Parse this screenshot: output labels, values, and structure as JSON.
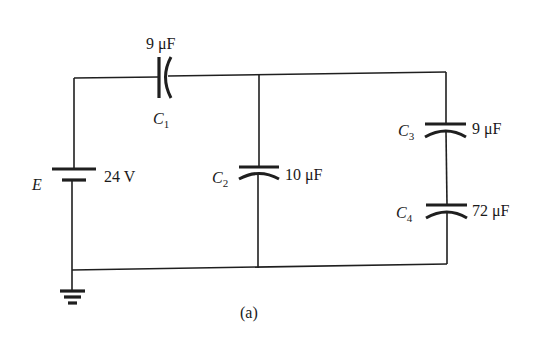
{
  "figure": {
    "caption": "(a)",
    "source": {
      "symbol": "E",
      "value": "24 V"
    },
    "capacitors": [
      {
        "id": "C1",
        "name": "C",
        "subscript": "1",
        "value": "9 μF",
        "position": "top wire, series"
      },
      {
        "id": "C2",
        "name": "C",
        "subscript": "2",
        "value": "10 μF",
        "position": "middle branch"
      },
      {
        "id": "C3",
        "name": "C",
        "subscript": "3",
        "value": "9 μF",
        "position": "right branch, upper"
      },
      {
        "id": "C4",
        "name": "C",
        "subscript": "4",
        "value": "72 μF",
        "position": "right branch, lower"
      }
    ],
    "ground": "ground-symbol"
  }
}
